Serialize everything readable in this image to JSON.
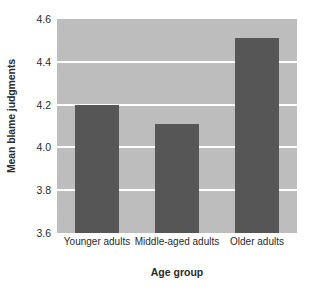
{
  "chart_data": {
    "type": "bar",
    "title": "",
    "xlabel": "Age group",
    "ylabel": "Mean blame judgments",
    "categories": [
      "Younger adults",
      "Middle-aged adults",
      "Older adults"
    ],
    "values": [
      4.2,
      4.11,
      4.51
    ],
    "ylim": [
      3.6,
      4.6
    ],
    "yticks": [
      3.6,
      3.8,
      4.0,
      4.2,
      4.4,
      4.6
    ],
    "ytick_labels": [
      "3.6",
      "3.8",
      "4.0",
      "4.2",
      "4.4",
      "4.6"
    ],
    "grid": true,
    "grid_color": "#ffffff",
    "legend": false,
    "bar_color": "#565656",
    "plot_background": "#bdbdbd",
    "page_background": "#ffffff",
    "text_color": "#2b2b2b"
  }
}
